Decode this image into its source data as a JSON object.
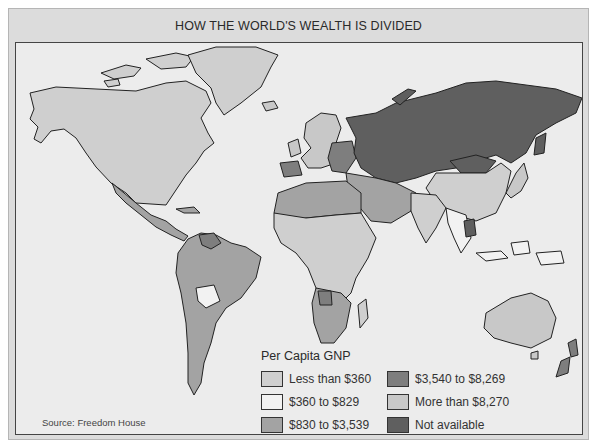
{
  "title": "HOW THE WORLD'S WEALTH IS DIVIDED",
  "source": "Source: Freedom House",
  "legend": {
    "title": "Per Capita GNP",
    "items": [
      {
        "label": "Less than $360",
        "color": "#cfcfcf"
      },
      {
        "label": "$360 to $829",
        "color": "#f2f2f2"
      },
      {
        "label": "$830 to $3,539",
        "color": "#a3a3a3"
      },
      {
        "label": "$3,540 to $8,269",
        "color": "#7e7e7e"
      },
      {
        "label": "More than $8,270",
        "color": "#c8c8c8"
      },
      {
        "label": "Not available",
        "color": "#5f5f5f"
      }
    ]
  },
  "regions": {
    "north_america": {
      "category": "More than $8,270"
    },
    "greenland": {
      "category": "More than $8,270"
    },
    "mexico_central_america": {
      "category": "$830 to $3,539"
    },
    "south_america": {
      "category": "$830 to $3,539"
    },
    "bolivia": {
      "category": "$360 to $829"
    },
    "venezuela": {
      "category": "$3,540 to $8,269"
    },
    "western_europe": {
      "category": "More than $8,270"
    },
    "eastern_europe": {
      "category": "$3,540 to $8,269"
    },
    "ussr": {
      "category": "Not available"
    },
    "mongolia": {
      "category": "Not available"
    },
    "china": {
      "category": "Less than $360"
    },
    "india": {
      "category": "Less than $360"
    },
    "middle_east": {
      "category": "$830 to $3,539"
    },
    "north_africa": {
      "category": "$830 to $3,539"
    },
    "sub_saharan_africa": {
      "category": "Less than $360"
    },
    "southern_africa": {
      "category": "$830 to $3,539"
    },
    "japan": {
      "category": "More than $8,270"
    },
    "southeast_asia": {
      "category": "$360 to $829"
    },
    "australia": {
      "category": "More than $8,270"
    },
    "new_zealand": {
      "category": "$3,540 to $8,269"
    }
  }
}
